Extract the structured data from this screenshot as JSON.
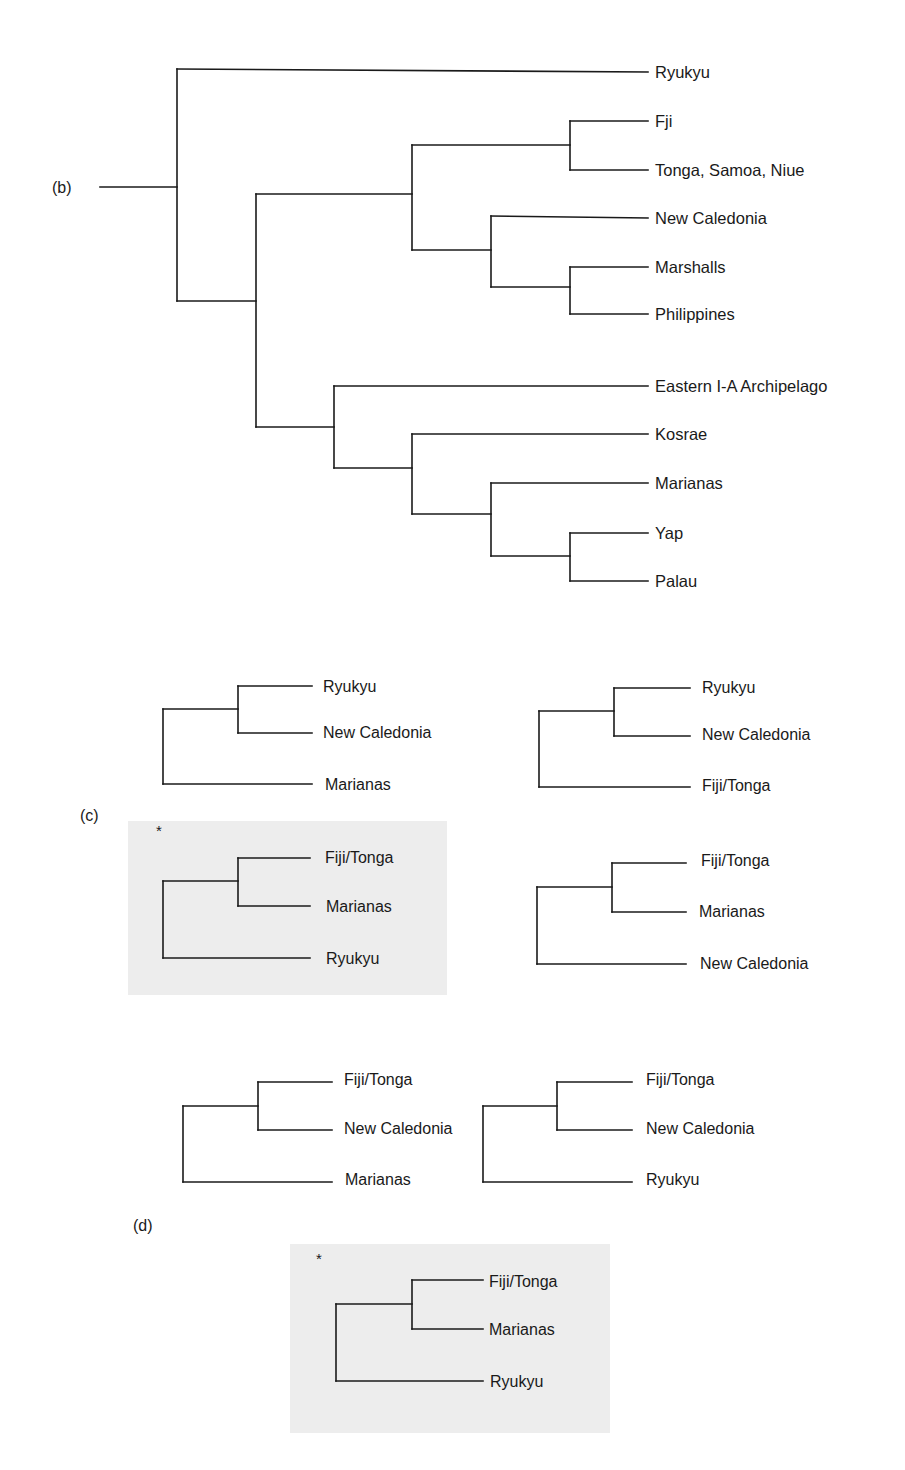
{
  "figure": {
    "panels": {
      "b": {
        "label": "(b)",
        "leaves": [
          "Ryukyu",
          "Fji",
          "Tonga, Samoa, Niue",
          "New Caledonia",
          "Marshalls",
          "Philippines",
          "Eastern I-A Archipelago",
          "Kosrae",
          "Marianas",
          "Yap",
          "Palau"
        ]
      },
      "c": {
        "label": "(c)",
        "trees": [
          {
            "leaves": [
              "Ryukyu",
              "New Caledonia",
              "Marianas"
            ],
            "highlighted": false,
            "marker": ""
          },
          {
            "leaves": [
              "Ryukyu",
              "New Caledonia",
              "Fiji/Tonga"
            ],
            "highlighted": false,
            "marker": ""
          },
          {
            "leaves": [
              "Fiji/Tonga",
              "Marianas",
              "Ryukyu"
            ],
            "highlighted": true,
            "marker": "*"
          },
          {
            "leaves": [
              "Fiji/Tonga",
              "Marianas",
              "New Caledonia"
            ],
            "highlighted": false,
            "marker": ""
          }
        ]
      },
      "d": {
        "label": "(d)",
        "trees": [
          {
            "leaves": [
              "Fiji/Tonga",
              "New Caledonia",
              "Marianas"
            ],
            "highlighted": false,
            "marker": ""
          },
          {
            "leaves": [
              "Fiji/Tonga",
              "New Caledonia",
              "Ryukyu"
            ],
            "highlighted": false,
            "marker": ""
          },
          {
            "leaves": [
              "Fiji/Tonga",
              "Marianas",
              "Ryukyu"
            ],
            "highlighted": true,
            "marker": "*"
          }
        ]
      }
    },
    "colors": {
      "line": "#1a1a1a",
      "highlight_background": "#ededed"
    }
  }
}
